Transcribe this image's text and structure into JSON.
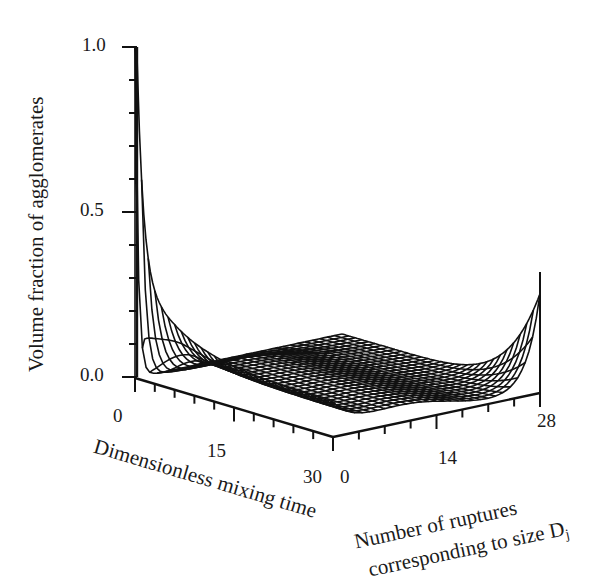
{
  "chart_data": {
    "type": "surface3d",
    "title": "",
    "zlabel": "Volume fraction of agglomerates",
    "xlabel": "Dimensionless mixing time",
    "ylabel_line1": "Number of ruptures",
    "ylabel_line2": "corresponding to size D",
    "ylabel_subscript": "j",
    "z_ticks": [
      "0.0",
      "0.5",
      "1.0"
    ],
    "z_range": [
      0.0,
      1.0
    ],
    "x_ticks": [
      "0",
      "15",
      "30"
    ],
    "x_range": [
      0,
      30
    ],
    "y_ticks": [
      "0",
      "14",
      "28"
    ],
    "y_range": [
      0,
      28
    ],
    "grid": false,
    "series": [
      {
        "name": "ruptures=0 edge (vs time)",
        "x": [
          0,
          1,
          3,
          6,
          10,
          15,
          20,
          25,
          30
        ],
        "values": [
          1.0,
          0.4,
          0.28,
          0.21,
          0.16,
          0.13,
          0.11,
          0.1,
          0.09
        ]
      },
      {
        "name": "time=30 edge (vs ruptures)",
        "x": [
          0,
          7,
          14,
          21,
          24,
          26,
          28
        ],
        "values": [
          0.09,
          0.08,
          0.06,
          0.04,
          0.06,
          0.14,
          0.32
        ]
      }
    ]
  },
  "labels": {
    "z_tick_0": "0.0",
    "z_tick_05": "0.5",
    "z_tick_1": "1.0",
    "x_tick_0": "0",
    "x_tick_15": "15",
    "x_tick_30": "30",
    "y_tick_0": "0",
    "y_tick_14": "14",
    "y_tick_28": "28",
    "zlabel": "Volume fraction of agglomerates",
    "xlabel": "Dimensionless mixing time",
    "ylabel_line1": "Number of ruptures",
    "ylabel_line2": "corresponding to size D",
    "ylabel_sub": "j"
  }
}
